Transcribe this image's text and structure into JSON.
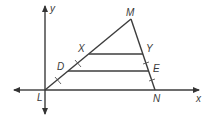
{
  "diagram": {
    "type": "geometry",
    "axes": {
      "x_label": "x",
      "y_label": "y"
    },
    "points": {
      "L": "L",
      "M": "M",
      "N": "N",
      "X": "X",
      "Y": "Y",
      "D": "D",
      "E": "E"
    },
    "segments": [
      "LM",
      "MN",
      "LN",
      "XY",
      "DE"
    ],
    "tick_marks": {
      "LM": "segments LD, DX marked congruent",
      "MN": "segments YE, EN marked congruent"
    },
    "colors": {
      "line": "#3c3c3c",
      "text": "#3a3a3a",
      "background": "#ffffff"
    }
  }
}
